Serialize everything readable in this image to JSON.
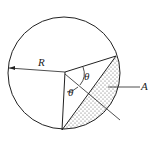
{
  "diagram": {
    "labels": {
      "radius": "R",
      "angle1": "θ",
      "angle2": "θ",
      "area": "A"
    },
    "colors": {
      "stroke": "#222222",
      "background": "#ffffff"
    }
  }
}
